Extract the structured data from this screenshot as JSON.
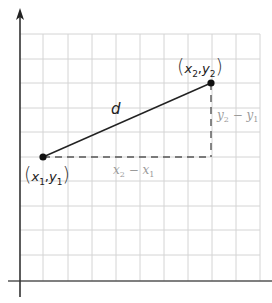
{
  "diagram": {
    "grid": {
      "color": "#d4d4d4",
      "x_lines": [
        43,
        68,
        92,
        116,
        140,
        164,
        188,
        212,
        236,
        260
      ],
      "y_lines": [
        34,
        59,
        83,
        108,
        132,
        157,
        181,
        206,
        230,
        255
      ],
      "top": 34,
      "bottom": 281,
      "left": 20,
      "right": 260
    },
    "axes": {
      "color": "#333333",
      "x_axis_y": 281,
      "y_axis_x": 20
    },
    "points": [
      {
        "id": "p1",
        "label_var_x": "x",
        "label_sub_x": "1",
        "label_var_y": "y",
        "label_sub_y": "1",
        "cx": 43,
        "cy": 157
      },
      {
        "id": "p2",
        "label_var_x": "x",
        "label_sub_x": "2",
        "label_var_y": "y",
        "label_sub_y": "2",
        "cx": 211,
        "cy": 83
      }
    ],
    "segment_label": "d",
    "horizontal_diff": {
      "a": "x",
      "a_sub": "2",
      "op": " − ",
      "b": "x",
      "b_sub": "1"
    },
    "vertical_diff": {
      "a": "y",
      "a_sub": "2",
      "op": " − ",
      "b": "y",
      "b_sub": "1"
    },
    "colors": {
      "line": "#222222",
      "point": "#111111",
      "dashed": "#555555",
      "diff_text": "#9a9a9a"
    }
  }
}
